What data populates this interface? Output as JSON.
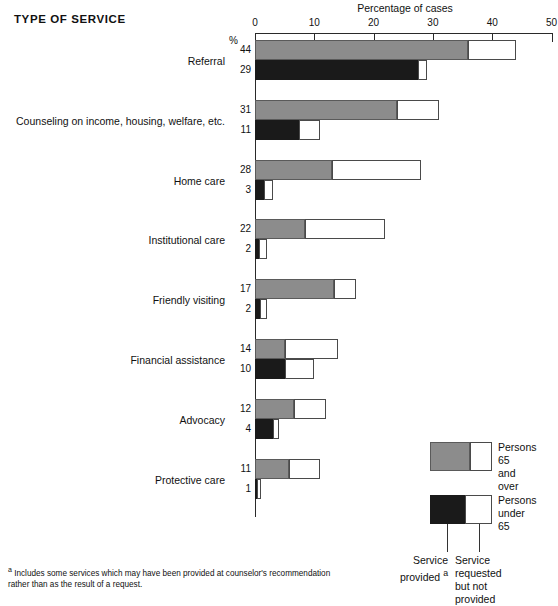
{
  "title": "TYPE OF SERVICE",
  "axis": {
    "title": "Percentage of cases",
    "unit_label": "%",
    "ticks": [
      0,
      10,
      20,
      30,
      40,
      50
    ],
    "tick_labels": [
      "0",
      "10",
      "20",
      "30",
      "40",
      "50"
    ]
  },
  "legend": {
    "items": [
      {
        "id": "over65",
        "label_line1": "Persons 65",
        "label_line2": "and over"
      },
      {
        "id": "under65",
        "label_line1": "Persons",
        "label_line2": "under 65"
      }
    ],
    "callouts": {
      "provided": {
        "line1": "Service",
        "line2": "provided",
        "superscript": "a"
      },
      "not_provided": {
        "line1": "Service",
        "line2": "requested",
        "line3": "but not",
        "line4": "provided"
      }
    }
  },
  "footnote": {
    "marker": "a",
    "text": "Includes some services which may have been provided at counselor's recommendation rather than as the result of a request."
  },
  "chart_data": {
    "type": "bar",
    "orientation": "horizontal",
    "title": "TYPE OF SERVICE",
    "xlabel": "Percentage of cases",
    "ylabel": "Type of service",
    "xlim": [
      0,
      50
    ],
    "xticks": [
      0,
      10,
      20,
      30,
      40,
      50
    ],
    "grid": false,
    "legend_position": "bottom-right",
    "stack_note": "Each bar is split: 'service provided' (solid) + 'service requested but not provided' (white). The printed number is the total.",
    "categories": [
      "Referral",
      "Counseling on income, housing, welfare, etc.",
      "Home care",
      "Institutional care",
      "Friendly visiting",
      "Financial assistance",
      "Advocacy",
      "Protective care"
    ],
    "series": [
      {
        "name": "Persons 65 and over",
        "color": "#8c8c8c",
        "totals": [
          44,
          31,
          28,
          22,
          17,
          14,
          12,
          11
        ],
        "provided": [
          36,
          24,
          13,
          8.5,
          13.3,
          5,
          6.5,
          5.7
        ],
        "requested_not_provided": [
          8,
          7,
          15,
          13.5,
          3.7,
          9,
          5.5,
          5.3
        ]
      },
      {
        "name": "Persons under 65",
        "color": "#1a1a1a",
        "totals": [
          29,
          11,
          3,
          2,
          2,
          10,
          4,
          1
        ],
        "provided": [
          27.5,
          7.5,
          1.5,
          0.6,
          0.8,
          5,
          3,
          0.35
        ],
        "requested_not_provided": [
          1.5,
          3.5,
          1.5,
          1.4,
          1.2,
          5,
          1,
          0.65
        ]
      }
    ]
  }
}
